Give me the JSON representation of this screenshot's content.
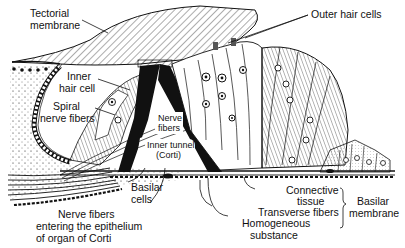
{
  "diagram": {
    "labels": {
      "tectorial_membrane": [
        "Tectorial",
        "membrane"
      ],
      "outer_hair_cells": "Outer hair cells",
      "inner_hair_cell": [
        "Inner",
        "hair cell"
      ],
      "spiral_nerve_fibers": [
        "Spiral",
        "nerve fibers"
      ],
      "nerve_fibers_center": [
        "Nerve",
        "fibers"
      ],
      "inner_tunnel": [
        "Inner tunnel",
        "(Corti)"
      ],
      "basilar_cells": [
        "Basilar",
        "cells"
      ],
      "nerve_fibers_entering": [
        "Nerve fibers",
        "entering the epithelium",
        "of organ of Corti"
      ],
      "connective_tissue": [
        "Connective",
        "tissue"
      ],
      "transverse_fibers": "Transverse fibers",
      "homogeneous_substance": [
        "Homogeneous",
        "substance"
      ],
      "basilar_membrane": [
        "Basilar",
        "membrane"
      ]
    },
    "colors": {
      "ink": "#111111",
      "paper": "#ffffff"
    }
  }
}
